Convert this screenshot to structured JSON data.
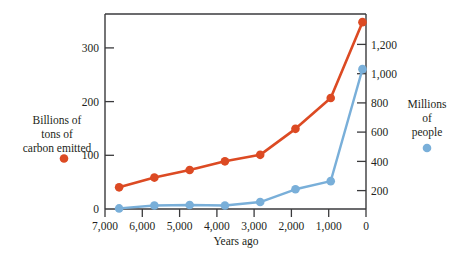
{
  "chart_data": {
    "type": "line",
    "title": "",
    "xlabel": "Years ago",
    "x": [
      7000,
      6000,
      5000,
      4000,
      3000,
      2000,
      1000,
      100
    ],
    "categories": [
      "7,000",
      "6,000",
      "5,000",
      "4,000",
      "3,000",
      "2,000",
      "1,000",
      "0"
    ],
    "xlim": [
      7400,
      0
    ],
    "grid": false,
    "legend_position": "outside-left-and-right",
    "series": [
      {
        "name": "Billions of tons of carbon emitted",
        "axis": "left",
        "color": "#dc4a23",
        "values": [
          40,
          58,
          72,
          88,
          100,
          148,
          205,
          345
        ]
      },
      {
        "name": "Millions of people",
        "axis": "right",
        "color": "#79afd9",
        "values": [
          5,
          30,
          35,
          30,
          60,
          170,
          240,
          1205
        ]
      }
    ],
    "left_axis": {
      "label_lines": [
        "Billions of",
        "tons of",
        "carbon emitted"
      ],
      "ticks": [
        0,
        100,
        200,
        300
      ],
      "tick_labels": [
        "0",
        "100",
        "200",
        "300"
      ],
      "ylim": [
        0,
        360
      ],
      "marker_color": "#dc4a23"
    },
    "right_axis": {
      "label_lines": [
        "Millions",
        "of",
        "people"
      ],
      "ticks": [
        200,
        400,
        600,
        800,
        1000,
        1200
      ],
      "tick_labels": [
        "200",
        "400",
        "600",
        "800",
        "1,000",
        "1,200"
      ],
      "ylim": [
        0,
        1680
      ],
      "marker_color": "#79afd9"
    }
  },
  "axes": {
    "x_title": "Years ago",
    "x_tick_labels": [
      "7,000",
      "6,000",
      "5,000",
      "4,000",
      "3,000",
      "2,000",
      "1,000",
      "0"
    ],
    "y_left_tick_labels": [
      "300",
      "200",
      "100",
      "0"
    ],
    "y_right_tick_labels": [
      "1,200",
      "1,000",
      "800",
      "600",
      "400",
      "200"
    ]
  },
  "legend": {
    "left": {
      "line1": "Billions of",
      "line2": "tons of",
      "line3": "carbon emitted",
      "color": "#dc4a23"
    },
    "right": {
      "line1": "Millions",
      "line2": "of",
      "line3": "people",
      "color": "#79afd9"
    }
  },
  "colors": {
    "carbon": "#dc4a23",
    "population": "#79afd9",
    "axis": "#3a3a3c",
    "text": "#231f20",
    "background": "#ffffff"
  }
}
